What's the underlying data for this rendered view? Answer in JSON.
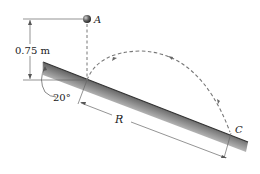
{
  "diagram": {
    "type": "projectile-on-incline",
    "labels": {
      "point_a": "A",
      "point_c": "C",
      "height": "0.75 m",
      "angle": "20°",
      "range": "R"
    },
    "colors": {
      "line": "#555555",
      "dash": "#777777",
      "ball": "#444444",
      "incline_dark": "#6a6a6a",
      "incline_light": "#ffffff"
    }
  }
}
